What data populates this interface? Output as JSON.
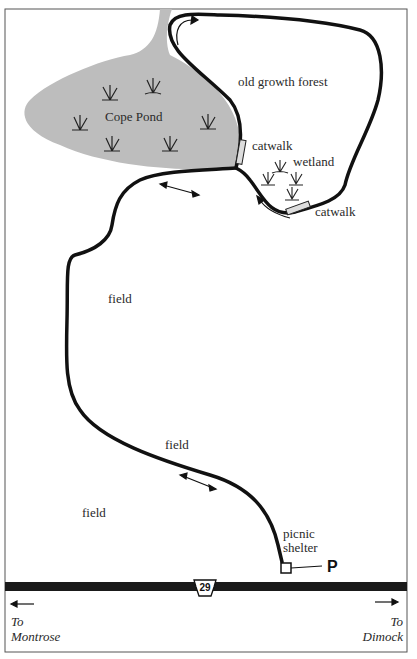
{
  "map": {
    "labels": {
      "pond": "Cope Pond",
      "forest": "old growth forest",
      "catwalk_1": "catwalk",
      "catwalk_2": "catwalk",
      "wetland": "wetland",
      "field_1": "field",
      "field_2": "field",
      "field_3": "field",
      "picnic_1": "picnic",
      "picnic_2": "shelter",
      "parking": "P"
    },
    "road": {
      "route_number": "29",
      "west_to": "To",
      "west_place": "Montrose",
      "east_to": "To",
      "east_place": "Dimock"
    },
    "colors": {
      "pond": "#bdbdbd",
      "trail": "#111111",
      "road": "#1a1a1a",
      "border": "#555555"
    }
  }
}
